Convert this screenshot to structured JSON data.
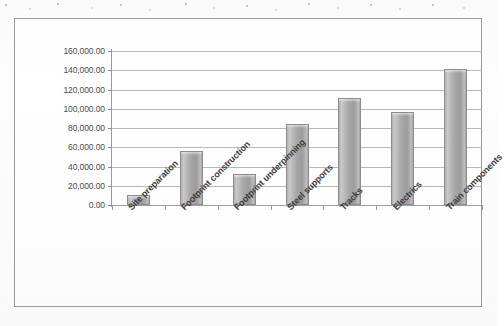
{
  "chart_data": {
    "type": "bar",
    "title": "",
    "subtitle": "",
    "xlabel": "",
    "ylabel": "",
    "categories": [
      "Site preparation",
      "Footprint construction",
      "Footprint underpinning",
      "Steel supports",
      "Tracks",
      "Electrics",
      "Train components"
    ],
    "values": [
      10000,
      56000,
      32000,
      84000,
      111000,
      97000,
      141000
    ],
    "ylim": [
      0,
      160000
    ],
    "ytick_step": 20000,
    "ytick_labels": [
      "0.00",
      "20,000.00",
      "40,000.00",
      "60,000.00",
      "80,000.00",
      "100,000.00",
      "120,000.00",
      "140,000.00",
      "160,000.00"
    ],
    "ytick_values": [
      0,
      20000,
      40000,
      60000,
      80000,
      100000,
      120000,
      140000,
      160000
    ],
    "grid": true,
    "grid_axis": "y",
    "legend": false,
    "legend_position": "none",
    "series": [
      {
        "name": "Cost",
        "values": [
          10000,
          56000,
          32000,
          84000,
          111000,
          97000,
          141000
        ]
      }
    ]
  },
  "style": {
    "bar_fill": "#aeaeae",
    "bar_border": "#8d8d8d",
    "gridline_color": "#b9b9b9",
    "axis_color": "#9a9a9a",
    "frame_border": "#9a9a9a",
    "label_color": "#3c3c3c",
    "tick_label_color": "#4a4a4a",
    "plot_background": "#ffffff",
    "page_background": "#fdfdfd"
  }
}
